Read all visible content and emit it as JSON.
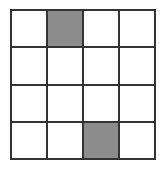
{
  "grid": {
    "rows": 4,
    "cols": 4,
    "line_color": "#333333",
    "empty_color": "#ffffff",
    "shaded_color": "#8c8c8c",
    "cells": [
      [
        0,
        1,
        0,
        0
      ],
      [
        0,
        0,
        0,
        0
      ],
      [
        0,
        0,
        0,
        0
      ],
      [
        0,
        0,
        1,
        0
      ]
    ],
    "shaded_cells": [
      {
        "row": 0,
        "col": 1
      },
      {
        "row": 3,
        "col": 2
      }
    ]
  }
}
